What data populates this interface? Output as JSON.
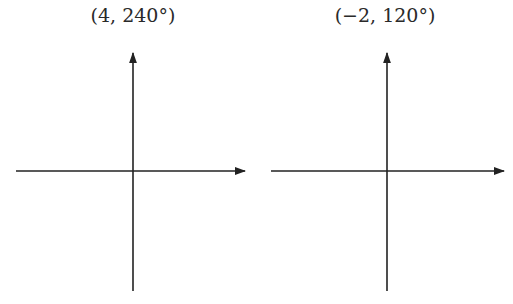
{
  "diagrams": [
    {
      "label": "(4, 240°)",
      "point": {
        "r": 4,
        "theta_deg": 240
      },
      "axes": {
        "origin": [
          133,
          171
        ],
        "x_axis": {
          "from": 16,
          "to": 245
        },
        "y_axis": {
          "from": 291,
          "to": 52
        }
      }
    },
    {
      "label": "(−2, 120°)",
      "point": {
        "r": -2,
        "theta_deg": 120
      },
      "axes": {
        "origin": [
          387,
          171
        ],
        "x_axis": {
          "from": 271,
          "to": 504
        },
        "y_axis": {
          "from": 291,
          "to": 52
        }
      }
    }
  ],
  "colors": {
    "axis": "#222222",
    "text": "#2a2a2a",
    "background": "#ffffff"
  }
}
